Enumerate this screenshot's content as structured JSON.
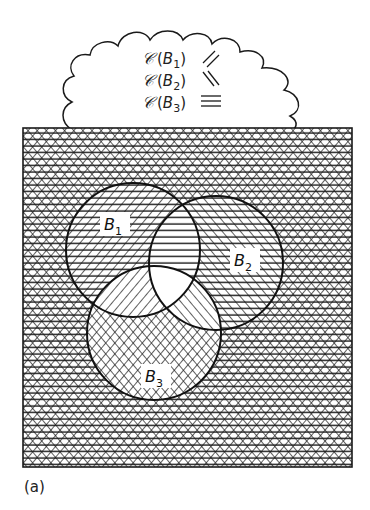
{
  "legend": {
    "items": [
      {
        "operator": "𝒞",
        "set": "B",
        "index": "1",
        "hatch": "slash",
        "hatch_symbol": "⁄⁄"
      },
      {
        "operator": "𝒞",
        "set": "B",
        "index": "2",
        "hatch": "backslash",
        "hatch_symbol": "\\\\"
      },
      {
        "operator": "𝒞",
        "set": "B",
        "index": "3",
        "hatch": "horizontal",
        "hatch_symbol": "≡"
      }
    ]
  },
  "venn": {
    "sets": [
      {
        "name": "B",
        "index": "1",
        "cx": 133,
        "cy": 250,
        "r": 67
      },
      {
        "name": "B",
        "index": "2",
        "cx": 216,
        "cy": 263,
        "r": 67
      },
      {
        "name": "B",
        "index": "3",
        "cx": 154,
        "cy": 333,
        "r": 67
      }
    ],
    "universe": {
      "x": 23,
      "y": 128,
      "width": 329,
      "height": 339
    },
    "regions": {
      "outside": "slash+backslash+horizontal",
      "B1_only": "backslash+horizontal",
      "B2_only": "slash+horizontal",
      "B3_only": "slash+backslash",
      "B1_B2": "horizontal",
      "B1_B3": "backslash",
      "B2_B3": "slash",
      "B1_B2_B3": "none"
    },
    "colors": {
      "ink": "#1a1a1a",
      "paper": "#ffffff"
    }
  },
  "caption": "(a)"
}
